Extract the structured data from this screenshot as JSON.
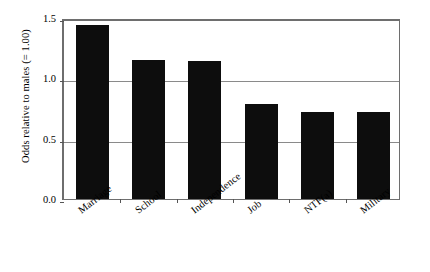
{
  "chart_data": {
    "type": "bar",
    "title": "",
    "subtitle": "",
    "xlabel": "",
    "ylabel": "Odds relative to males (= 1.00)",
    "categories": [
      "Marriage",
      "School",
      "Independence",
      "Job",
      "NTF(a)",
      "Military"
    ],
    "values": [
      1.44,
      1.15,
      1.14,
      0.79,
      0.72,
      0.72
    ],
    "ylim": [
      0.0,
      1.5
    ],
    "yticks": [
      "0.0",
      "0.5",
      "1.0",
      "1.5"
    ],
    "ytick_values": [
      0.0,
      0.5,
      1.0,
      1.5
    ],
    "grid": true,
    "gridlines_at": [
      0.5,
      1.0
    ],
    "legend": null,
    "legend_position": "none",
    "series": [
      {
        "name": "Odds relative to males",
        "values": [
          1.44,
          1.15,
          1.14,
          0.79,
          0.72,
          0.72
        ]
      }
    ],
    "bar_color": "#0d0d0d",
    "axis_color": "#6e6e6e",
    "grid_color": "#8a8a8a",
    "background_color": "#ffffff"
  }
}
